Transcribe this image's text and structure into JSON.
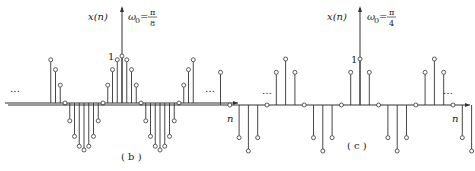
{
  "chart_data": [
    {
      "type": "stem",
      "panel_label": "( b )",
      "ylabel": "x(n)",
      "xlabel": "n",
      "omega_label": "ω0 = π/8",
      "omega_numerator": "π",
      "omega_denominator": "8",
      "peak_label": "1",
      "ellipsis": "…",
      "function": "cos(πn/8)",
      "n": [
        -14,
        -13,
        -12,
        -11,
        -10,
        -9,
        -8,
        -7,
        -6,
        -5,
        -4,
        -3,
        -2,
        -1,
        0,
        1,
        2,
        3,
        4,
        5,
        6,
        7,
        8,
        9,
        10,
        11,
        12,
        13,
        14
      ],
      "values": [
        0.92,
        0.71,
        0.38,
        0,
        -0.38,
        -0.71,
        -0.92,
        -1,
        -0.92,
        -0.71,
        -0.38,
        0,
        0.38,
        0.71,
        0.92,
        1,
        0.92,
        0.71,
        0.38,
        0,
        -0.38,
        -0.71,
        -0.92,
        -1,
        -0.92,
        -0.71,
        -0.38,
        0,
        0.38,
        0.71,
        0.92
      ]
    },
    {
      "type": "stem",
      "panel_label": "( c )",
      "ylabel": "x(n)",
      "xlabel": "n",
      "omega_label": "ω0 = π/4",
      "omega_numerator": "π",
      "omega_denominator": "4",
      "peak_label": "1",
      "ellipsis": "…",
      "function": "cos(πn/4)",
      "n": [
        -15,
        -14,
        -13,
        -12,
        -11,
        -10,
        -9,
        -8,
        -7,
        -6,
        -5,
        -4,
        -3,
        -2,
        -1,
        0,
        1,
        2,
        3,
        4,
        5,
        6,
        7,
        8,
        9,
        10,
        11,
        12,
        13,
        14,
        15
      ],
      "values": [
        0.71,
        0,
        -0.71,
        -1,
        -0.71,
        0,
        0.71,
        1,
        0.71,
        0,
        -0.71,
        -1,
        -0.71,
        0,
        0.71,
        1,
        0.71,
        0,
        -0.71,
        -1,
        -0.71,
        0,
        0.71,
        1,
        0.71,
        0,
        -0.71,
        -1,
        -0.71,
        0,
        0.71
      ]
    }
  ]
}
